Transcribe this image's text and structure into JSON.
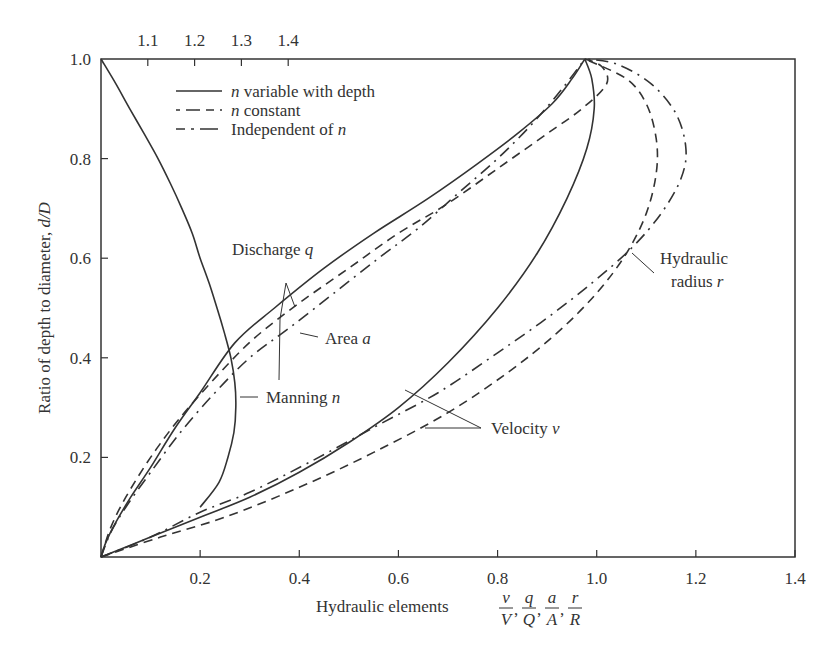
{
  "chart_data": {
    "type": "line",
    "title": "",
    "xlabel": "Hydraulic elements v/V, q/Q, a/A, r/R",
    "xlabel_prefix": "Hydraulic elements",
    "xlabel_fractions": [
      {
        "num": "v",
        "den": "V"
      },
      {
        "num": "q",
        "den": "Q"
      },
      {
        "num": "a",
        "den": "A"
      },
      {
        "num": "r",
        "den": "R"
      }
    ],
    "ylabel": "Ratio of depth to diameter, d/D",
    "ylabel_prefix": "Ratio of depth to diameter, ",
    "ylabel_italic": "d/D",
    "xlim": [
      0,
      1.4
    ],
    "ylim": [
      0,
      1.0
    ],
    "x_ticks": [
      "0.2",
      "0.4",
      "0.6",
      "0.8",
      "1.0",
      "1.2",
      "1.4"
    ],
    "x_tick_values": [
      0.2,
      0.4,
      0.6,
      0.8,
      1.0,
      1.2,
      1.4
    ],
    "y_ticks": [
      "0.2",
      "0.4",
      "0.6",
      "0.8",
      "1.0"
    ],
    "y_tick_values": [
      0.2,
      0.4,
      0.6,
      0.8,
      1.0
    ],
    "top_axis": {
      "label": "Manning n ratio (n/N)",
      "ticks": [
        "1.1",
        "1.2",
        "1.3",
        "1.4"
      ],
      "tick_values": [
        1.1,
        1.2,
        1.3,
        1.4
      ]
    },
    "grid": false,
    "legend": {
      "position": "upper-left",
      "entries": [
        {
          "style": "solid",
          "label_italic": "n",
          "label": " variable with depth"
        },
        {
          "style": "dashed",
          "label_italic": "n",
          "label": " constant"
        },
        {
          "style": "dashdot",
          "label": "Independent of ",
          "label_italic_suffix": "n"
        }
      ]
    },
    "series": [
      {
        "name": "Manning n (n variable with depth)",
        "style": "solid",
        "points": [
          [
            0.0,
            1.0
          ],
          [
            0.03,
            0.95
          ],
          [
            0.058,
            0.9
          ],
          [
            0.087,
            0.85
          ],
          [
            0.115,
            0.8
          ],
          [
            0.14,
            0.75
          ],
          [
            0.163,
            0.7
          ],
          [
            0.184,
            0.65
          ],
          [
            0.2,
            0.6
          ],
          [
            0.218,
            0.55
          ],
          [
            0.234,
            0.5
          ],
          [
            0.249,
            0.45
          ],
          [
            0.262,
            0.4
          ],
          [
            0.27,
            0.35
          ],
          [
            0.272,
            0.3
          ],
          [
            0.268,
            0.25
          ],
          [
            0.256,
            0.2
          ],
          [
            0.238,
            0.15
          ],
          [
            0.2,
            0.1
          ]
        ]
      },
      {
        "name": "Discharge q (n variable with depth)",
        "style": "solid",
        "points": [
          [
            0.0,
            0.0
          ],
          [
            0.01,
            0.03
          ],
          [
            0.03,
            0.07
          ],
          [
            0.06,
            0.12
          ],
          [
            0.1,
            0.18
          ],
          [
            0.15,
            0.26
          ],
          [
            0.2,
            0.33
          ],
          [
            0.27,
            0.43
          ],
          [
            0.35,
            0.5
          ],
          [
            0.45,
            0.58
          ],
          [
            0.55,
            0.65
          ],
          [
            0.66,
            0.72
          ],
          [
            0.76,
            0.79
          ],
          [
            0.84,
            0.85
          ],
          [
            0.91,
            0.91
          ],
          [
            0.95,
            0.96
          ],
          [
            0.976,
            1.0
          ]
        ]
      },
      {
        "name": "Discharge q (n constant)",
        "style": "dashed",
        "points": [
          [
            0.0,
            0.0
          ],
          [
            0.02,
            0.06
          ],
          [
            0.05,
            0.12
          ],
          [
            0.1,
            0.2
          ],
          [
            0.16,
            0.28
          ],
          [
            0.24,
            0.37
          ],
          [
            0.31,
            0.44
          ],
          [
            0.4,
            0.51
          ],
          [
            0.5,
            0.58
          ],
          [
            0.6,
            0.65
          ],
          [
            0.7,
            0.71
          ],
          [
            0.8,
            0.78
          ],
          [
            0.9,
            0.85
          ],
          [
            0.97,
            0.9
          ],
          [
            1.02,
            0.95
          ],
          [
            1.01,
            0.985
          ],
          [
            0.976,
            1.0
          ]
        ]
      },
      {
        "name": "Area a (independent of n)",
        "style": "dashdot",
        "points": [
          [
            0.0,
            0.0
          ],
          [
            0.02,
            0.05
          ],
          [
            0.05,
            0.1
          ],
          [
            0.1,
            0.17
          ],
          [
            0.16,
            0.25
          ],
          [
            0.23,
            0.33
          ],
          [
            0.3,
            0.4
          ],
          [
            0.38,
            0.46
          ],
          [
            0.47,
            0.53
          ],
          [
            0.56,
            0.6
          ],
          [
            0.64,
            0.66
          ],
          [
            0.72,
            0.73
          ],
          [
            0.8,
            0.8
          ],
          [
            0.87,
            0.87
          ],
          [
            0.93,
            0.94
          ],
          [
            0.976,
            1.0
          ]
        ]
      },
      {
        "name": "Velocity v (n variable with depth)",
        "style": "solid",
        "points": [
          [
            0.0,
            0.0
          ],
          [
            0.1,
            0.04
          ],
          [
            0.2,
            0.08
          ],
          [
            0.3,
            0.12
          ],
          [
            0.4,
            0.17
          ],
          [
            0.5,
            0.23
          ],
          [
            0.6,
            0.3
          ],
          [
            0.7,
            0.39
          ],
          [
            0.8,
            0.5
          ],
          [
            0.88,
            0.61
          ],
          [
            0.94,
            0.72
          ],
          [
            0.98,
            0.82
          ],
          [
            0.995,
            0.9
          ],
          [
            0.99,
            0.96
          ],
          [
            0.976,
            1.0
          ]
        ]
      },
      {
        "name": "Velocity v (n constant)",
        "style": "dashed",
        "points": [
          [
            0.0,
            0.0
          ],
          [
            0.12,
            0.04
          ],
          [
            0.25,
            0.08
          ],
          [
            0.4,
            0.14
          ],
          [
            0.55,
            0.21
          ],
          [
            0.7,
            0.29
          ],
          [
            0.82,
            0.37
          ],
          [
            0.92,
            0.45
          ],
          [
            1.0,
            0.53
          ],
          [
            1.06,
            0.61
          ],
          [
            1.1,
            0.69
          ],
          [
            1.12,
            0.77
          ],
          [
            1.12,
            0.84
          ],
          [
            1.1,
            0.91
          ],
          [
            1.06,
            0.96
          ],
          [
            0.976,
            1.0
          ]
        ]
      },
      {
        "name": "Hydraulic radius r (independent of n)",
        "style": "dashdot",
        "points": [
          [
            0.0,
            0.0
          ],
          [
            0.1,
            0.04
          ],
          [
            0.2,
            0.09
          ],
          [
            0.3,
            0.13
          ],
          [
            0.42,
            0.19
          ],
          [
            0.55,
            0.26
          ],
          [
            0.68,
            0.33
          ],
          [
            0.8,
            0.41
          ],
          [
            0.9,
            0.48
          ],
          [
            0.99,
            0.55
          ],
          [
            1.07,
            0.62
          ],
          [
            1.13,
            0.69
          ],
          [
            1.17,
            0.76
          ],
          [
            1.18,
            0.82
          ],
          [
            1.16,
            0.89
          ],
          [
            1.11,
            0.95
          ],
          [
            1.04,
            0.99
          ],
          [
            0.976,
            1.0
          ]
        ]
      }
    ],
    "annotations": [
      {
        "text": "Discharge ",
        "italic": "q",
        "x": 0.26,
        "y": 0.62
      },
      {
        "text": "Area ",
        "italic": "a",
        "x": 0.46,
        "y": 0.43
      },
      {
        "text": "Manning ",
        "italic": "n",
        "x": 0.33,
        "y": 0.33
      },
      {
        "text": "Velocity ",
        "italic": "v",
        "x": 0.71,
        "y": 0.25
      },
      {
        "text": "Hydraulic",
        "x": 1.1,
        "y": 0.62
      },
      {
        "text": "radius ",
        "italic": "r",
        "x": 1.11,
        "y": 0.56
      }
    ]
  }
}
